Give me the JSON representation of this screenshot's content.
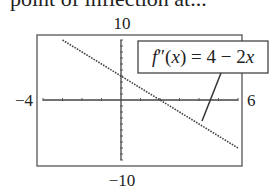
{
  "caption": "point of inflection at...",
  "chart_data": {
    "type": "line",
    "title": "",
    "xlabel": "",
    "ylabel": "",
    "xlim": [
      -4,
      6
    ],
    "ylim": [
      -10,
      10
    ],
    "window_labels": {
      "xmin": "−4",
      "xmax": "6",
      "ymin": "−10",
      "ymax": "10"
    },
    "grid": false,
    "x_ticks_step": 1,
    "y_ticks_step": 1,
    "series": [
      {
        "name": "f''(x) = 4 − 2x",
        "equation": "4 - 2x",
        "style": "dotted",
        "x": [
          -3,
          -2,
          -1,
          0,
          1,
          2,
          3,
          4,
          5,
          6
        ],
        "y": [
          10,
          8,
          6,
          4,
          2,
          0,
          -2,
          -4,
          -6,
          -8
        ]
      }
    ],
    "annotations": [
      {
        "text": "f′′(x) = 4 − 2x",
        "boxed": true,
        "leader_line_to": [
          4.2,
          -3.3
        ]
      }
    ],
    "legend_position": "none"
  }
}
